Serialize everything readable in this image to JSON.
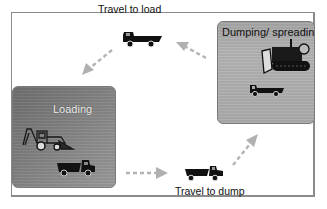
{
  "diagram": {
    "title": "",
    "type": "cycle",
    "stages": [
      {
        "id": "loading",
        "label": "Loading",
        "icons": [
          "backhoe-loader-icon",
          "dump-truck-icon"
        ]
      },
      {
        "id": "travel_to_dump",
        "label": "Travel to dump",
        "icons": [
          "dump-truck-loaded-icon"
        ]
      },
      {
        "id": "dumping",
        "label": "Dumping/ spreading",
        "icons": [
          "bulldozer-icon",
          "dump-truck-icon"
        ]
      },
      {
        "id": "travel_to_load",
        "label": "Travel to load",
        "icons": [
          "dump-truck-empty-icon"
        ]
      }
    ],
    "flow": [
      {
        "from": "loading",
        "to": "travel_to_dump"
      },
      {
        "from": "travel_to_dump",
        "to": "dumping"
      },
      {
        "from": "dumping",
        "to": "travel_to_load"
      },
      {
        "from": "travel_to_load",
        "to": "loading"
      }
    ],
    "colors": {
      "arrow": "#b0b0b0",
      "loading_box": "#7f7f7f",
      "dumping_box": "#adadad",
      "truck": "#111111",
      "frame": "#8a8a8a"
    }
  }
}
